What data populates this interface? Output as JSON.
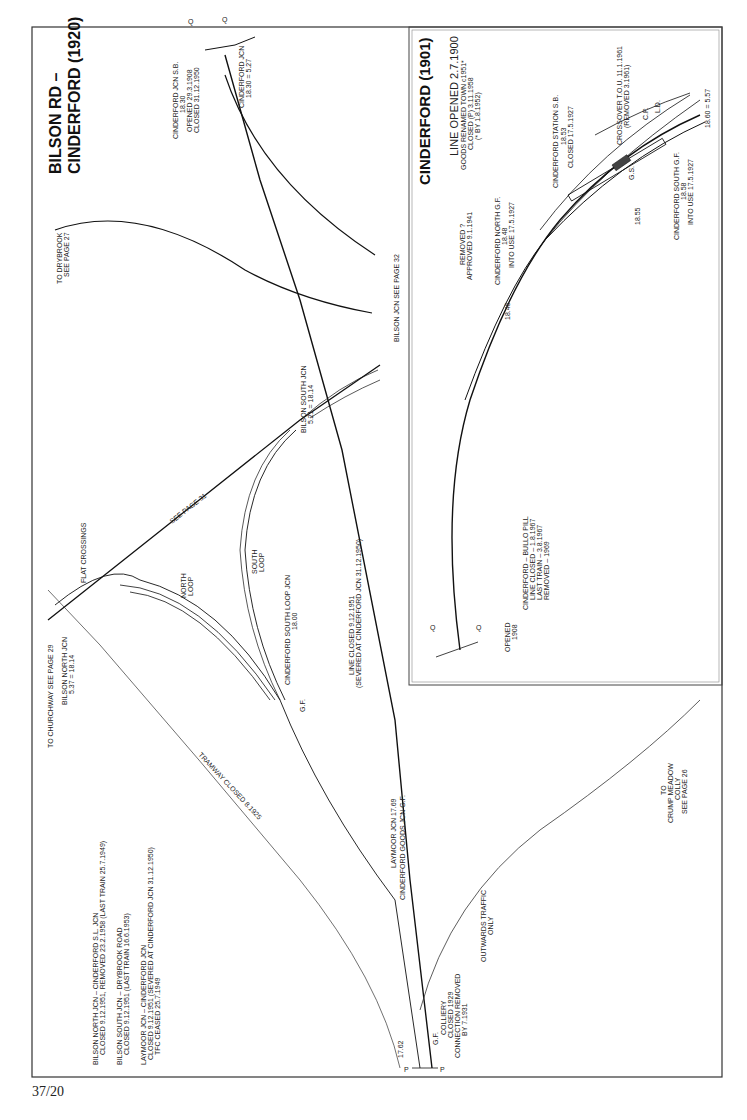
{
  "page": {
    "page_number": "37/20"
  },
  "main_map": {
    "title_line1": "BILSON RD –",
    "title_line2": "CINDERFORD (1920)",
    "labels": {
      "cinderford_jcn_sb_1": "CINDERFORD JCN S.B.",
      "cinderford_jcn_sb_2": "18.30",
      "cinderford_jcn_sb_3": "OPENED 29.3.1908",
      "cinderford_jcn_sb_4": "CLOSED 31.12.1950",
      "cinderford_jcn_1": "CINDERFORD JCN",
      "cinderford_jcn_2": "18.30 = 5.27",
      "to_drybrook_1": "TO DRYBROOK",
      "to_drybrook_2": "SEE PAGE 27",
      "bilson_jcn": "BILSON JCN   SEE PAGE 32",
      "bilson_south_1": "BILSON SOUTH JCN",
      "bilson_south_2": "5.21 = 18.14",
      "see_page_31": "SEE   PAGE   31",
      "flat_crossings": "FLAT CROSSINGS",
      "to_churchway": "TO CHURCHWAY   SEE PAGE 29",
      "bilson_north_1": "BILSON NORTH JCN",
      "bilson_north_2": "5.37 = 18.14",
      "north_loop_1": "NORTH",
      "north_loop_2": "LOOP",
      "south_loop_1": "SOUTH",
      "south_loop_2": "LOOP",
      "cinderford_south_loop_1": "CINDERFORD SOUTH LOOP JCN",
      "cinderford_south_loop_2": "18.00",
      "gf_1": "G.F.",
      "line_closed_1": "LINE CLOSED 9.12.1951",
      "line_closed_2": "(SEVERED AT CINDERFORD JCN 31.12.1950)",
      "tramway": "TRAMWAY CLOSED 8.1925",
      "laymoor_1": "LAYMOOR JCN 17.69",
      "laymoor_2": "CINDERFORD GOODS JCN G.F.",
      "note1_1": "BILSON NORTH JCN – CINDERFORD S.L. JCN",
      "note1_2": "CLOSED 9.12.1951, REMOVED 23.2.1958 (LAST TRAIN 25.7.1949)",
      "note2_1": "BILSON SOUTH JCN – DRYBROOK ROAD",
      "note2_2": "CLOSED 9.12.1951 (LAST TRAIN 16.6.1953)",
      "note3_1": "LAYMOOR JCN – CINDERFORD JCN",
      "note3_2": "CLOSED 9.12.1951 (SEVERED AT CINDERFORD JCN 31.12.1950)",
      "note3_3": "TFC CEASED 25.7.1949",
      "mp_1762": "17.62",
      "gf_2": "G.F.",
      "colliery_1": "COLLIERY",
      "colliery_2": "CLOSED 1929",
      "colliery_3": "CONNECTION REMOVED",
      "colliery_4": "BY 7.1931",
      "outwards_1": "OUTWARDS TRAFFIC",
      "outwards_2": "ONLY",
      "crump_1": "TO",
      "crump_2": "CRUMP MEADOW",
      "crump_3": "COLLY",
      "crump_4": "SEE PAGE 26",
      "p_left": "P",
      "p_right": "P",
      "q_left": "Q",
      "q_right": "Q"
    }
  },
  "inset_map": {
    "title": "CINDERFORD (1901)",
    "labels": {
      "line_opened": "LINE OPENED 2.7.1900",
      "goods_renamed": "GOODS RENAMED TOWN c1951*",
      "closed_p": "CLOSED (P) 3.11.1958",
      "by_note": "(* BY 1.8.1952)",
      "station_sb_1": "CINDERFORD STATION S.B.",
      "station_sb_2": "18.53",
      "station_sb_3": "CLOSED 17.5.1927",
      "crossover_1": "CROSSOVER T.O.U. 11.1.1961",
      "crossover_2": "(REMOVED 3.1961)",
      "cp": "C.P.",
      "ld": "L.D.",
      "gs": "G.S.",
      "mp_1860": "18.60 = 5.57",
      "mp_1855": "18.55",
      "south_gf_1": "CINDERFORD SOUTH G.F.",
      "south_gf_2": "18.58",
      "south_gf_3": "INTO USE 17.5.1927",
      "north_gf_1": "CINDERFORD NORTH G.F.",
      "north_gf_2": "18.48",
      "north_gf_3": "INTO USE 17.5.1927",
      "removed_1": "REMOVED ?",
      "removed_2": "APPROVED 9.1.1941",
      "mp_1846": "18.46",
      "bullo_1": "CINDERFORD – BULLO PILL",
      "bullo_2": "LINE CLOSED  –  1.8.1967",
      "bullo_3": "LAST TRAIN    –  3.8.1967",
      "bullo_4": "REMOVED       –     1969",
      "opened_1": "OPENED",
      "opened_2": "1908",
      "q_left": "Q",
      "q_right": "Q"
    }
  }
}
